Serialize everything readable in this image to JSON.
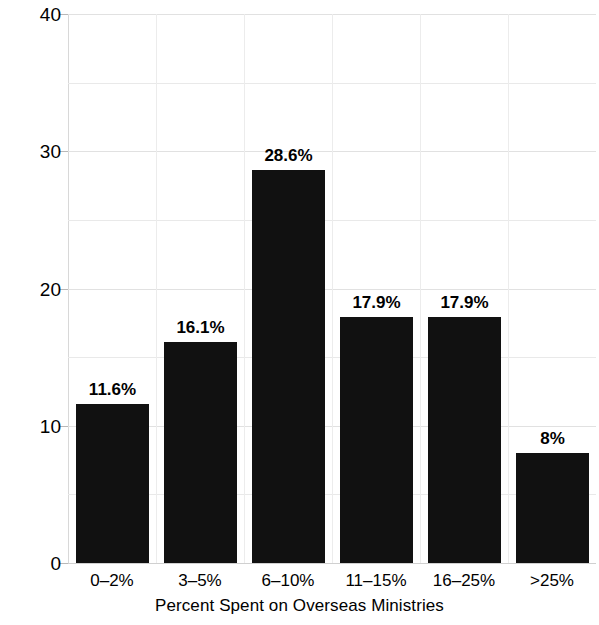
{
  "chart_data": {
    "type": "bar",
    "title": "",
    "xlabel": "Percent Spent on Overseas Ministries",
    "ylabel": "Percent",
    "categories": [
      "0–2%",
      "3–5%",
      "6–10%",
      "11–15%",
      "16–25%",
      ">25%"
    ],
    "values": [
      11.6,
      16.1,
      28.6,
      17.9,
      17.9,
      8
    ],
    "data_labels": [
      "11.6%",
      "16.1%",
      "28.6%",
      "17.9%",
      "17.9%",
      "8%"
    ],
    "ylim": [
      0,
      40
    ],
    "ytick_labels": [
      "0",
      "10",
      "20",
      "30",
      "40"
    ],
    "ytick_values": [
      0,
      10,
      20,
      30,
      40
    ],
    "minor_gridline_values": [
      5,
      15,
      25,
      35
    ],
    "grid": true,
    "legend": false,
    "bar_color": "#111111",
    "grid_color": "#e9e9e9",
    "background_color": "#ffffff"
  }
}
